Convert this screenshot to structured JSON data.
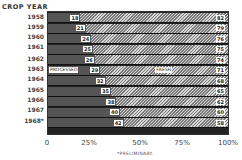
{
  "chart_data": {
    "type": "bar",
    "orientation": "horizontal-stacked-100",
    "title": "CROP YEAR",
    "xlabel": "",
    "ylabel": "CROP YEAR",
    "categories": [
      "1958",
      "1959",
      "1960",
      "1961",
      "1962",
      "1963",
      "1964",
      "1965",
      "1966",
      "1967",
      "1968*"
    ],
    "series": [
      {
        "name": "PROCESSED",
        "values": [
          18,
          21,
          24,
          25,
          26,
          29,
          32,
          35,
          38,
          40,
          42
        ]
      },
      {
        "name": "FRESH",
        "values": [
          82,
          79,
          76,
          75,
          74,
          71,
          68,
          65,
          62,
          60,
          58
        ]
      }
    ],
    "x_ticks": [
      "0",
      "25%",
      "50%",
      "75%",
      "100%"
    ],
    "xlim": [
      0,
      100
    ],
    "annotations": [
      "PROCESSED",
      "FRESH",
      "*PRELIMINARY."
    ],
    "grid": false,
    "legend": "inline labels in 1963 bar"
  },
  "header": {
    "title": "CROP YEAR"
  },
  "rows": [
    {
      "year": "1958",
      "processed": "18",
      "fresh": "82",
      "p": 18
    },
    {
      "year": "1959",
      "processed": "21",
      "fresh": "79",
      "p": 21
    },
    {
      "year": "1960",
      "processed": "24",
      "fresh": "76",
      "p": 24
    },
    {
      "year": "1961",
      "processed": "25",
      "fresh": "75",
      "p": 25
    },
    {
      "year": "1962",
      "processed": "26",
      "fresh": "74",
      "p": 26
    },
    {
      "year": "1963",
      "processed": "29",
      "fresh": "71",
      "p": 29
    },
    {
      "year": "1964",
      "processed": "32",
      "fresh": "68",
      "p": 32
    },
    {
      "year": "1965",
      "processed": "35",
      "fresh": "65",
      "p": 35
    },
    {
      "year": "1966",
      "processed": "38",
      "fresh": "62",
      "p": 38
    },
    {
      "year": "1967",
      "processed": "40",
      "fresh": "60",
      "p": 40
    },
    {
      "year": "1968*",
      "processed": "42",
      "fresh": "58",
      "p": 42
    }
  ],
  "segment_labels": {
    "processed": "PROCESSED",
    "fresh": "FRESH"
  },
  "x_axis": {
    "ticks": [
      "0",
      "25%",
      "50%",
      "75%",
      "100%"
    ]
  },
  "footnote": "*PRELIMINARY."
}
